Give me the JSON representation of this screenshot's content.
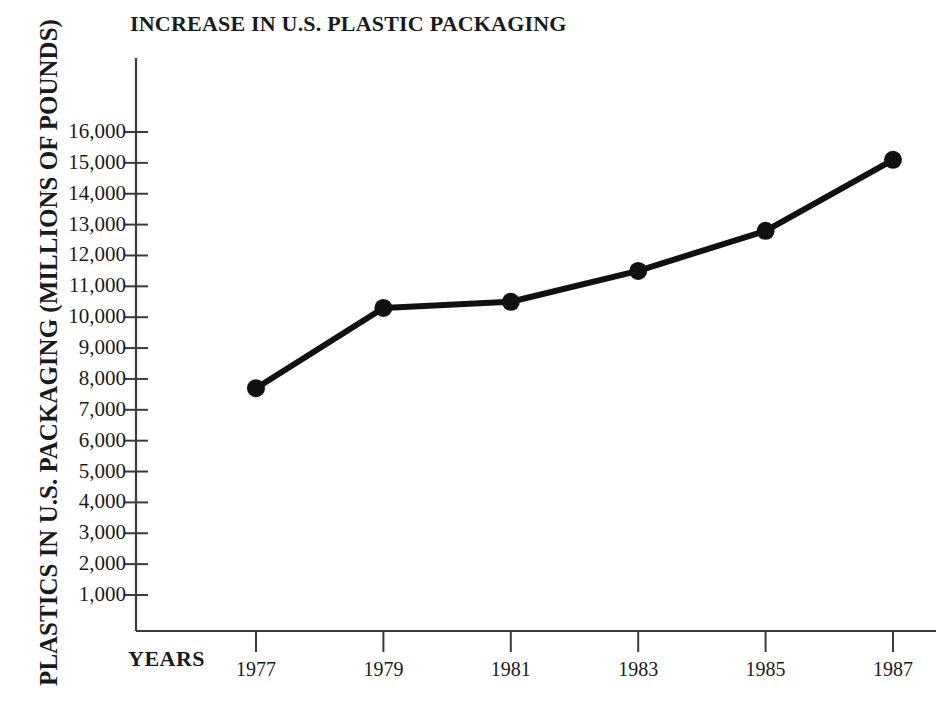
{
  "chart_data": {
    "type": "line",
    "title": "INCREASE IN U.S. PLASTIC PACKAGING",
    "xlabel": "YEARS",
    "ylabel": "PLASTICS IN U.S. PACKAGING (MILLIONS OF POUNDS)",
    "categories": [
      "1977",
      "1979",
      "1981",
      "1983",
      "1985",
      "1987"
    ],
    "x": [
      1977,
      1979,
      1981,
      1983,
      1985,
      1987
    ],
    "values": [
      7700,
      10300,
      10500,
      11500,
      12800,
      15100
    ],
    "series": [
      {
        "name": "Plastics in U.S. packaging",
        "values": [
          7700,
          10300,
          10500,
          11500,
          12800,
          15100
        ]
      }
    ],
    "ylim": [
      0,
      17500
    ],
    "xlim": [
      1976,
      1988
    ],
    "yticks": [
      1000,
      2000,
      3000,
      4000,
      5000,
      6000,
      7000,
      8000,
      9000,
      10000,
      11000,
      12000,
      13000,
      14000,
      15000,
      16000
    ],
    "ytick_labels": [
      "1,000",
      "2,000",
      "3,000",
      "4,000",
      "5,000",
      "6,000",
      "7,000",
      "8,000",
      "9,000",
      "10,000",
      "11,000",
      "12,000",
      "13,000",
      "14,000",
      "15,000",
      "16,000"
    ],
    "xtick_labels": [
      "1977",
      "1979",
      "1981",
      "1983",
      "1985",
      "1987"
    ],
    "grid": false,
    "legend": false,
    "legend_position": "none",
    "marker": "filled-circle",
    "line_color": "#111111",
    "marker_color": "#111111",
    "axis_color": "#333333",
    "background_color": "#ffffff"
  },
  "colors": {
    "line": "#111111",
    "marker": "#111111",
    "axis": "#3a3a3a",
    "text": "#1a1a1a",
    "background": "#ffffff"
  }
}
